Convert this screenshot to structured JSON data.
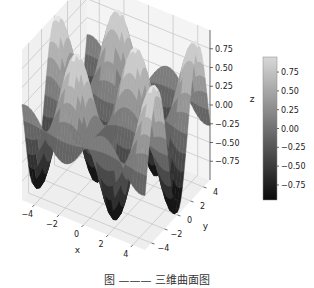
{
  "chart_data": {
    "type": "surface3d",
    "function": "z = sin(x) * cos(y)",
    "x_range": [
      -5,
      5
    ],
    "y_range": [
      -5,
      5
    ],
    "z_range": [
      -1,
      1
    ],
    "xlabel": "x",
    "ylabel": "y",
    "zlabel": "z",
    "x_ticks": [
      "−4",
      "−2",
      "0",
      "2",
      "4"
    ],
    "y_ticks": [
      "−4",
      "−2",
      "0",
      "2",
      "4"
    ],
    "z_ticks": [
      "0.75",
      "0.50",
      "0.25",
      "0.00",
      "−0.25",
      "−0.50",
      "−0.75"
    ],
    "colormap": "gray",
    "colorbar": {
      "ticks": [
        "0.75",
        "0.50",
        "0.25",
        "0.00",
        "−0.25",
        "−0.50",
        "−0.75"
      ],
      "min": -0.95,
      "max": 0.95,
      "color_low": "#0a0a0a",
      "color_high": "#d8d8d8"
    },
    "grid": true,
    "pane_color": "#f2f2f2",
    "grid_color": "#c8c8c8"
  },
  "caption": {
    "text": "图 ——— 三维曲面图"
  }
}
